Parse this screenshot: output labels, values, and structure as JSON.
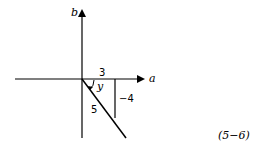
{
  "diagram": {
    "axes": {
      "horizontal_label": "a",
      "vertical_label": "b"
    },
    "triangle": {
      "adjacent_label": "3",
      "opposite_label": "−4",
      "hypotenuse_label": "5",
      "angle_label": "y"
    },
    "equation_number": "(5−6)",
    "colors": {
      "stroke": "#000000",
      "background": "#ffffff"
    }
  }
}
